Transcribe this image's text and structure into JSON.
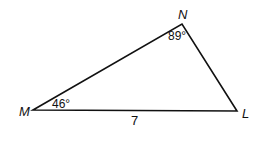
{
  "diagram": {
    "type": "triangle",
    "vertices": [
      {
        "name": "M",
        "x": 33,
        "y": 110
      },
      {
        "name": "N",
        "x": 182,
        "y": 24
      },
      {
        "name": "L",
        "x": 237,
        "y": 111
      }
    ],
    "labels": {
      "vertex_m": "M",
      "vertex_n": "N",
      "vertex_l": "L",
      "angle_m": "46°",
      "angle_n": "89°",
      "side_ml": "7"
    },
    "line_color": "#111111"
  }
}
